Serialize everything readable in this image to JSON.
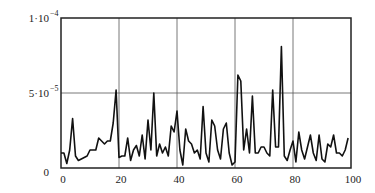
{
  "chart_data": {
    "type": "line",
    "title": "",
    "xlabel": "",
    "ylabel": "",
    "xlim": [
      0,
      100
    ],
    "ylim": [
      0,
      0.0001
    ],
    "grid": true,
    "legend": null,
    "x_ticks": [
      0,
      20,
      40,
      60,
      80,
      100
    ],
    "x_tick_labels": [
      "0",
      "20",
      "40",
      "60",
      "80",
      "100"
    ],
    "y_ticks": [
      0,
      5e-05,
      0.0001
    ],
    "y_tick_labels": [
      {
        "base": "0",
        "exp": ""
      },
      {
        "base": "5·10",
        "exp": "−5"
      },
      {
        "base": "1·10",
        "exp": "−4"
      }
    ],
    "series": [
      {
        "name": "signal",
        "color": "#111111",
        "x": [
          0,
          1,
          2,
          3,
          4,
          5,
          6,
          7,
          8,
          9,
          10,
          11,
          12,
          13,
          14,
          15,
          16,
          17,
          18,
          19,
          20,
          21,
          22,
          23,
          24,
          25,
          26,
          27,
          28,
          29,
          30,
          31,
          32,
          33,
          34,
          35,
          36,
          37,
          38,
          39,
          40,
          41,
          42,
          43,
          44,
          45,
          46,
          47,
          48,
          49,
          50,
          51,
          52,
          53,
          54,
          55,
          56,
          57,
          58,
          59,
          60,
          61,
          62,
          63,
          64,
          65,
          66,
          67,
          68,
          69,
          70,
          71,
          72,
          73,
          74,
          75,
          76,
          77,
          78,
          79,
          80,
          81,
          82,
          83,
          84,
          85,
          86,
          87,
          88,
          89,
          90,
          91,
          92,
          93,
          94,
          95,
          96,
          97,
          98,
          99
        ],
        "values": [
          1e-05,
          1e-05,
          3e-06,
          1.2e-05,
          3.3e-05,
          8e-06,
          5e-06,
          6e-06,
          7e-06,
          8e-06,
          1.2e-05,
          1.2e-05,
          1.2e-05,
          2e-05,
          1.8e-05,
          1.6e-05,
          1.8e-05,
          1.8e-05,
          3e-05,
          5.2e-05,
          7e-06,
          8e-06,
          8e-06,
          2e-05,
          5e-06,
          1.2e-05,
          1.5e-05,
          8e-06,
          2.2e-05,
          6e-06,
          3.2e-05,
          1.2e-05,
          5e-05,
          8e-06,
          1.6e-05,
          1e-05,
          1.4e-05,
          8e-06,
          2.8e-05,
          2.4e-05,
          3.8e-05,
          1.2e-05,
          2e-06,
          2.6e-05,
          1.8e-05,
          1.6e-05,
          1e-05,
          1.2e-05,
          6e-06,
          4.1e-05,
          1e-05,
          4e-06,
          3.2e-05,
          2.8e-05,
          1.2e-05,
          6e-06,
          2.6e-05,
          3e-05,
          1e-05,
          2e-06,
          4e-06,
          6.2e-05,
          5.8e-05,
          1.2e-05,
          2.6e-05,
          1e-05,
          4.8e-05,
          1e-05,
          1e-05,
          1.4e-05,
          1.4e-05,
          1e-05,
          8e-06,
          5.2e-05,
          1.4e-05,
          1.4e-05,
          8.1e-05,
          8e-06,
          5e-06,
          1.2e-05,
          1.8e-05,
          4e-06,
          2.4e-05,
          1.2e-05,
          6e-06,
          1.4e-05,
          2.2e-05,
          1e-05,
          5e-06,
          2.2e-05,
          6e-06,
          4e-06,
          1.6e-05,
          1.4e-05,
          2.2e-05,
          1e-05,
          1e-05,
          8e-06,
          1.2e-05,
          2e-05
        ]
      }
    ]
  }
}
